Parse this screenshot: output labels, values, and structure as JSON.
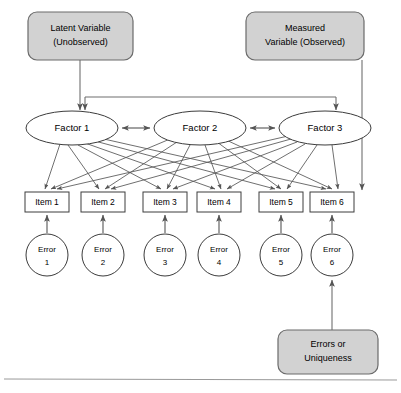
{
  "diagram": {
    "type": "path-diagram",
    "colors": {
      "callout_fill": "#d2d2d2",
      "callout_stroke": "#6b6b6b",
      "node_fill": "#ffffff",
      "node_stroke": "#444444",
      "arrow_stroke": "#555555",
      "background": "#ffffff",
      "frame_line": "#9a9a9a"
    },
    "callouts": [
      {
        "id": "latent-variable-callout",
        "line1": "Latent Variable",
        "line2": "(Unobserved)",
        "x": 28,
        "y": 12,
        "w": 105,
        "h": 48
      },
      {
        "id": "measured-variable-callout",
        "line1": "Measured",
        "line2": "Variable (Observed)",
        "x": 246,
        "y": 12,
        "w": 118,
        "h": 48
      },
      {
        "id": "errors-uniqueness-callout",
        "line1": "Errors or",
        "line2": "Uniqueness",
        "x": 278,
        "y": 330,
        "w": 100,
        "h": 44
      }
    ],
    "factors": [
      {
        "id": "factor-1",
        "label": "Factor 1",
        "cx": 72,
        "cy": 128,
        "rx": 46,
        "ry": 17
      },
      {
        "id": "factor-2",
        "label": "Factor 2",
        "cx": 200,
        "cy": 128,
        "rx": 46,
        "ry": 17
      },
      {
        "id": "factor-3",
        "label": "Factor 3",
        "cx": 325,
        "cy": 128,
        "rx": 46,
        "ry": 17
      }
    ],
    "factor_correlations": [
      {
        "from": "factor-1",
        "to": "factor-2",
        "style": "double-headed"
      },
      {
        "from": "factor-2",
        "to": "factor-3",
        "style": "double-headed"
      }
    ],
    "items": [
      {
        "id": "item-1",
        "label": "Item 1",
        "x": 25,
        "y": 192,
        "w": 44,
        "h": 20
      },
      {
        "id": "item-2",
        "label": "Item 2",
        "x": 81,
        "y": 192,
        "w": 44,
        "h": 20
      },
      {
        "id": "item-3",
        "label": "Item 3",
        "x": 143,
        "y": 192,
        "w": 44,
        "h": 20
      },
      {
        "id": "item-4",
        "label": "Item 4",
        "x": 197,
        "y": 192,
        "w": 44,
        "h": 20
      },
      {
        "id": "item-5",
        "label": "Item 5",
        "x": 259,
        "y": 192,
        "w": 44,
        "h": 20
      },
      {
        "id": "item-6",
        "label": "Item 6",
        "x": 310,
        "y": 192,
        "w": 44,
        "h": 20
      }
    ],
    "errors": [
      {
        "id": "error-1",
        "line1": "Error",
        "line2": "1",
        "cx": 47,
        "cy": 255,
        "r": 21
      },
      {
        "id": "error-2",
        "line1": "Error",
        "line2": "2",
        "cx": 103,
        "cy": 255,
        "r": 21
      },
      {
        "id": "error-3",
        "line1": "Error",
        "line2": "3",
        "cx": 165,
        "cy": 255,
        "r": 21
      },
      {
        "id": "error-4",
        "line1": "Error",
        "line2": "4",
        "cx": 219,
        "cy": 255,
        "r": 21
      },
      {
        "id": "error-5",
        "line1": "Error",
        "line2": "5",
        "cx": 281,
        "cy": 255,
        "r": 21
      },
      {
        "id": "error-6",
        "line1": "Error",
        "line2": "6",
        "cx": 332,
        "cy": 255,
        "r": 21
      }
    ],
    "loadings_note": "Every factor loads on every item (fully crossed)",
    "frame": {
      "bottom_line_y": 379
    }
  }
}
